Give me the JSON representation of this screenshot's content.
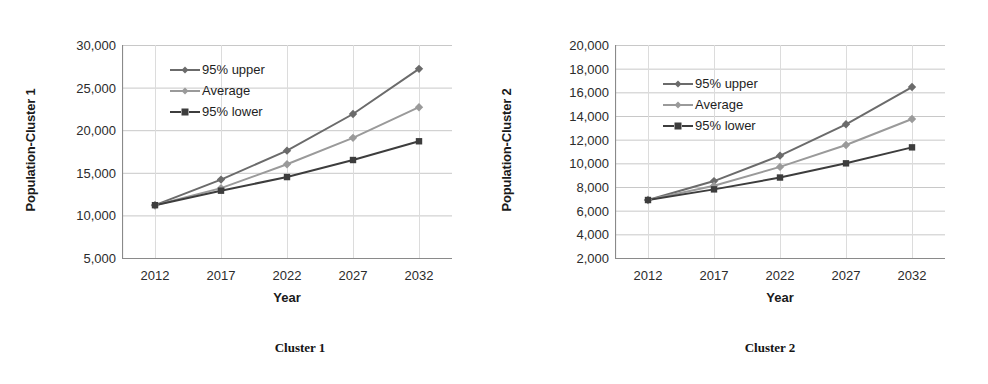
{
  "figure": {
    "panels": [
      {
        "id": "cluster-1",
        "caption": "Cluster 1",
        "ylabel": "Population-Cluster 1",
        "xlabel": "Year"
      },
      {
        "id": "cluster-2",
        "caption": "Cluster 2",
        "ylabel": "Population-Cluster 2",
        "xlabel": "Year"
      }
    ],
    "colors": {
      "upper": "#6b6b6b",
      "average": "#9a9a9a",
      "lower": "#3d3d3d",
      "grid": "#c8c8c8",
      "axis": "#8a8a8a",
      "text": "#1f1f1f"
    }
  },
  "chart_data": [
    {
      "type": "line",
      "title": "Cluster 1",
      "xlabel": "Year",
      "ylabel": "Population-Cluster 1",
      "categories": [
        "2012",
        "2017",
        "2022",
        "2027",
        "2032"
      ],
      "x": [
        2012,
        2017,
        2022,
        2027,
        2032
      ],
      "xticklabels": [
        "2012",
        "2017",
        "2022",
        "2027",
        "2032"
      ],
      "yticklabels": [
        "5,000",
        "10,000",
        "15,000",
        "20,000",
        "25,000",
        "30,000"
      ],
      "yticks": [
        5000,
        10000,
        15000,
        20000,
        25000,
        30000
      ],
      "ylim": [
        5000,
        30000
      ],
      "grid": true,
      "legend": "inside-top-left",
      "series": [
        {
          "name": "95% upper",
          "values": [
            11200,
            14200,
            17600,
            21900,
            27200
          ],
          "color": "#6b6b6b",
          "marker": "diamond",
          "dash": false
        },
        {
          "name": "Average",
          "values": [
            11200,
            13200,
            16000,
            19100,
            22700
          ],
          "color": "#9a9a9a",
          "marker": "diamond",
          "dash": false
        },
        {
          "name": "95% lower",
          "values": [
            11200,
            12900,
            14500,
            16500,
            18700
          ],
          "color": "#3d3d3d",
          "marker": "square",
          "dash": true
        }
      ]
    },
    {
      "type": "line",
      "title": "Cluster 2",
      "xlabel": "Year",
      "ylabel": "Population-Cluster 2",
      "categories": [
        "2012",
        "2017",
        "2022",
        "2027",
        "2032"
      ],
      "x": [
        2012,
        2017,
        2022,
        2027,
        2032
      ],
      "xticklabels": [
        "2012",
        "2017",
        "2022",
        "2027",
        "2032"
      ],
      "yticklabels": [
        "2,000",
        "4,000",
        "6,000",
        "8,000",
        "10,000",
        "12,000",
        "14,000",
        "16,000",
        "18,000",
        "20,000"
      ],
      "yticks": [
        2000,
        4000,
        6000,
        8000,
        10000,
        12000,
        14000,
        16000,
        18000,
        20000
      ],
      "ylim": [
        2000,
        20000
      ],
      "grid": true,
      "legend": "inside-top-left",
      "series": [
        {
          "name": "95% upper",
          "values": [
            6900,
            8500,
            10650,
            13300,
            16450
          ],
          "color": "#6b6b6b",
          "marker": "diamond",
          "dash": false
        },
        {
          "name": "Average",
          "values": [
            6900,
            8100,
            9700,
            11550,
            13750
          ],
          "color": "#9a9a9a",
          "marker": "diamond",
          "dash": false
        },
        {
          "name": "95% lower",
          "values": [
            6900,
            7800,
            8800,
            10000,
            11350
          ],
          "color": "#3d3d3d",
          "marker": "square",
          "dash": true
        }
      ]
    }
  ]
}
